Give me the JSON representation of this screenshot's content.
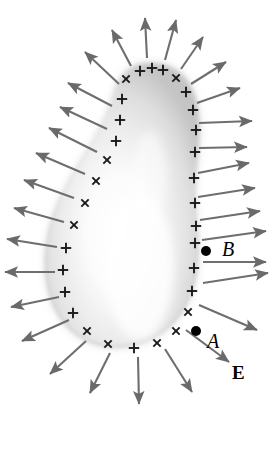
{
  "figure": {
    "type": "physics-field-diagram",
    "background_color": "#ffffff",
    "arrow_color": "#6e6e6e",
    "arrow_color_dark": "#585858",
    "charge_mark_color": "#1a1a1a",
    "dot_color": "#000000",
    "surface_fill_light": "#ffffff",
    "surface_fill_mid": "#d9d9d9",
    "surface_fill_edge": "#b6b6b6"
  },
  "labels": [
    {
      "name": "point-b-label",
      "text": "B",
      "style": "italic",
      "x": 222,
      "y": 256,
      "size": 20
    },
    {
      "name": "point-a-label",
      "text": "A",
      "style": "italic",
      "x": 207,
      "y": 348,
      "size": 20
    },
    {
      "name": "field-label-e",
      "text": "E",
      "style": "bold",
      "x": 232,
      "y": 379,
      "size": 19
    }
  ],
  "points": [
    {
      "name": "point-b-dot",
      "label": "B",
      "x": 206,
      "y": 251,
      "r": 5.0
    },
    {
      "name": "point-a-dot",
      "label": "A",
      "x": 196,
      "y": 331,
      "r": 5.0
    }
  ],
  "surface_outline": "M 152 64 C 170 64 184 74 191 89 C 198 104 199 121 198 139 C 197 157 194 176 194 196 C 194 214 197 231 197 249 C 197 268 194 287 186 303 C 177 321 162 334 144 341 C 126 348 107 348 90 341 C 73 334 61 321 54 304 C 47 287 45 268 47 249 C 49 230 55 212 63 195 C 72 177 83 161 93 144 C 103 127 111 110 115 93 C 119 79 128 68 140 65 C 144 64 148 64 152 64 Z",
  "charge_marks": [
    {
      "kind": "x",
      "x": 126,
      "y": 79,
      "rot": 0
    },
    {
      "kind": "plus",
      "x": 140,
      "y": 71,
      "rot": 0
    },
    {
      "kind": "plus",
      "x": 152,
      "y": 68,
      "rot": 0
    },
    {
      "kind": "plus",
      "x": 163,
      "y": 70,
      "rot": 0
    },
    {
      "kind": "x",
      "x": 176,
      "y": 78,
      "rot": 0
    },
    {
      "kind": "plus",
      "x": 186,
      "y": 92,
      "rot": 0
    },
    {
      "kind": "plus",
      "x": 193,
      "y": 110,
      "rot": 0
    },
    {
      "kind": "plus",
      "x": 196,
      "y": 130,
      "rot": 0
    },
    {
      "kind": "plus",
      "x": 195,
      "y": 152,
      "rot": 0
    },
    {
      "kind": "plus",
      "x": 194,
      "y": 178,
      "rot": 0
    },
    {
      "kind": "plus",
      "x": 195,
      "y": 203,
      "rot": 0
    },
    {
      "kind": "plus",
      "x": 196,
      "y": 226,
      "rot": 0
    },
    {
      "kind": "plus",
      "x": 195,
      "y": 243,
      "rot": 0
    },
    {
      "kind": "plus",
      "x": 194,
      "y": 268,
      "rot": 0
    },
    {
      "kind": "plus",
      "x": 192,
      "y": 291,
      "rot": 0
    },
    {
      "kind": "x",
      "x": 188,
      "y": 312,
      "rot": 0
    },
    {
      "kind": "x",
      "x": 176,
      "y": 331,
      "rot": 0
    },
    {
      "kind": "x",
      "x": 157,
      "y": 343,
      "rot": 0
    },
    {
      "kind": "plus",
      "x": 134,
      "y": 348,
      "rot": 0
    },
    {
      "kind": "x",
      "x": 108,
      "y": 344,
      "rot": 0
    },
    {
      "kind": "x",
      "x": 87,
      "y": 331,
      "rot": 0
    },
    {
      "kind": "plus",
      "x": 73,
      "y": 313,
      "rot": 0
    },
    {
      "kind": "plus",
      "x": 65,
      "y": 292,
      "rot": 0
    },
    {
      "kind": "plus",
      "x": 63,
      "y": 270,
      "rot": 0
    },
    {
      "kind": "plus",
      "x": 66,
      "y": 248,
      "rot": 0
    },
    {
      "kind": "x",
      "x": 74,
      "y": 225,
      "rot": 0
    },
    {
      "kind": "x",
      "x": 85,
      "y": 203,
      "rot": 0
    },
    {
      "kind": "x",
      "x": 96,
      "y": 181,
      "rot": 0
    },
    {
      "kind": "x",
      "x": 107,
      "y": 160,
      "rot": 0
    },
    {
      "kind": "plus",
      "x": 116,
      "y": 141,
      "rot": 0
    },
    {
      "kind": "plus",
      "x": 120,
      "y": 120,
      "rot": 0
    },
    {
      "kind": "plus",
      "x": 122,
      "y": 99,
      "rot": 0
    }
  ],
  "field_arrows": [
    {
      "x1": 147,
      "y1": 58,
      "x2": 145,
      "y2": 18
    },
    {
      "x1": 165,
      "y1": 60,
      "x2": 176,
      "y2": 20
    },
    {
      "x1": 181,
      "y1": 69,
      "x2": 203,
      "y2": 37
    },
    {
      "x1": 191,
      "y1": 84,
      "x2": 226,
      "y2": 62
    },
    {
      "x1": 197,
      "y1": 103,
      "x2": 240,
      "y2": 88
    },
    {
      "x1": 199,
      "y1": 123,
      "x2": 252,
      "y2": 121
    },
    {
      "x1": 199,
      "y1": 148,
      "x2": 247,
      "y2": 147
    },
    {
      "x1": 198,
      "y1": 173,
      "x2": 249,
      "y2": 163
    },
    {
      "x1": 198,
      "y1": 197,
      "x2": 255,
      "y2": 188
    },
    {
      "x1": 200,
      "y1": 220,
      "x2": 260,
      "y2": 211
    },
    {
      "x1": 202,
      "y1": 240,
      "x2": 266,
      "y2": 231
    },
    {
      "x1": 203,
      "y1": 262,
      "x2": 266,
      "y2": 262
    },
    {
      "x1": 203,
      "y1": 283,
      "x2": 268,
      "y2": 273
    },
    {
      "x1": 199,
      "y1": 305,
      "x2": 257,
      "y2": 330
    },
    {
      "x1": 186,
      "y1": 330,
      "x2": 229,
      "y2": 362
    },
    {
      "x1": 165,
      "y1": 349,
      "x2": 192,
      "y2": 392
    },
    {
      "x1": 138,
      "y1": 357,
      "x2": 139,
      "y2": 404
    },
    {
      "x1": 110,
      "y1": 353,
      "x2": 90,
      "y2": 393
    },
    {
      "x1": 86,
      "y1": 341,
      "x2": 50,
      "y2": 374
    },
    {
      "x1": 69,
      "y1": 320,
      "x2": 22,
      "y2": 341
    },
    {
      "x1": 59,
      "y1": 297,
      "x2": 11,
      "y2": 307
    },
    {
      "x1": 55,
      "y1": 272,
      "x2": 5,
      "y2": 272
    },
    {
      "x1": 57,
      "y1": 247,
      "x2": 7,
      "y2": 239
    },
    {
      "x1": 64,
      "y1": 222,
      "x2": 14,
      "y2": 208
    },
    {
      "x1": 74,
      "y1": 198,
      "x2": 24,
      "y2": 180
    },
    {
      "x1": 85,
      "y1": 174,
      "x2": 36,
      "y2": 153
    },
    {
      "x1": 97,
      "y1": 152,
      "x2": 49,
      "y2": 128
    },
    {
      "x1": 107,
      "y1": 129,
      "x2": 60,
      "y2": 107
    },
    {
      "x1": 112,
      "y1": 106,
      "x2": 68,
      "y2": 83
    },
    {
      "x1": 119,
      "y1": 84,
      "x2": 85,
      "y2": 52
    },
    {
      "x1": 131,
      "y1": 66,
      "x2": 112,
      "y2": 30
    }
  ]
}
